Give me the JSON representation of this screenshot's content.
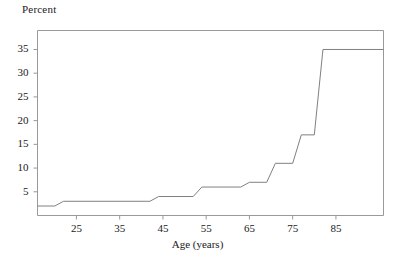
{
  "chart_data": {
    "type": "line",
    "title": "",
    "subtitle": "",
    "ylabel": "Percent",
    "xlabel": "Age (years)",
    "ylabel_position": "top-left",
    "grid": false,
    "legend": false,
    "legend_position": "none",
    "line_color": "#808080",
    "axis_color": "#999999",
    "background": "#ffffff",
    "xlim": [
      16,
      96
    ],
    "ylim": [
      0,
      39
    ],
    "xticks": [
      25,
      35,
      45,
      55,
      65,
      75,
      85
    ],
    "xtick_labels": [
      "25",
      "35",
      "45",
      "55",
      "65",
      "75",
      "85"
    ],
    "yticks": [
      5,
      10,
      15,
      20,
      25,
      30,
      35
    ],
    "ytick_labels": [
      "5",
      "10",
      "15",
      "20",
      "25",
      "30",
      "35"
    ],
    "series": [
      {
        "name": "percent-by-age",
        "step": true,
        "x": [
          16,
          20,
          22,
          42,
          44,
          52,
          54,
          63,
          65,
          69,
          71,
          75,
          77,
          80,
          82,
          96
        ],
        "y": [
          2,
          2,
          3,
          3,
          4,
          4,
          6,
          6,
          7,
          7,
          11,
          11,
          17,
          17,
          35,
          35
        ]
      }
    ],
    "annotations": []
  },
  "figure": {
    "ylabel_text": "Percent",
    "xlabel_text": "Age (years)"
  }
}
